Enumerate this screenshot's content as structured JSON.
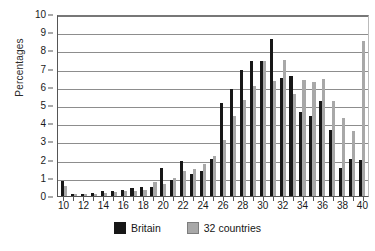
{
  "chart_data": {
    "type": "bar",
    "title": "",
    "xlabel": "",
    "ylabel": "Percentages",
    "ylim": [
      0,
      10
    ],
    "ytick_step": 1,
    "grid": true,
    "legend_position": "bottom",
    "categories": [
      10,
      11,
      12,
      13,
      14,
      15,
      16,
      17,
      18,
      19,
      20,
      21,
      22,
      23,
      24,
      25,
      26,
      27,
      28,
      29,
      30,
      31,
      32,
      33,
      34,
      35,
      36,
      37,
      38,
      39,
      40
    ],
    "xtick_labels": [
      "10",
      "",
      "12",
      "",
      "14",
      "",
      "16",
      "",
      "18",
      "",
      "20",
      "",
      "22",
      "",
      "24",
      "",
      "26",
      "",
      "28",
      "",
      "30",
      "",
      "32",
      "",
      "34",
      "",
      "36",
      "",
      "38",
      "",
      "40"
    ],
    "ytick_labels": [
      "0",
      "1",
      "2",
      "3",
      "4",
      "5",
      "6",
      "7",
      "8",
      "9",
      "10"
    ],
    "series": [
      {
        "name": "Britain",
        "color": "#171717",
        "values": [
          0.8,
          0.1,
          0.1,
          0.15,
          0.3,
          0.3,
          0.35,
          0.45,
          0.5,
          0.5,
          1.55,
          0.9,
          1.95,
          1.2,
          1.35,
          2.05,
          5.1,
          5.9,
          6.9,
          7.4,
          7.4,
          8.6,
          6.5,
          6.6,
          4.6,
          4.4,
          5.2,
          3.6,
          1.55,
          2.05,
          2.0
        ]
      },
      {
        "name": "32 countries",
        "color": "#a8a8a8",
        "values": [
          0.55,
          0.1,
          0.1,
          0.1,
          0.15,
          0.2,
          0.25,
          0.3,
          0.35,
          0.75,
          0.65,
          1.0,
          1.35,
          1.5,
          1.75,
          2.2,
          3.1,
          4.4,
          5.3,
          6.05,
          7.4,
          6.3,
          7.5,
          5.6,
          6.4,
          6.25,
          6.45,
          5.2,
          4.3,
          3.55,
          8.5
        ]
      }
    ]
  },
  "legend": {
    "items": [
      {
        "label": "Britain",
        "color": "#171717"
      },
      {
        "label": "32 countries",
        "color": "#a8a8a8"
      }
    ]
  }
}
